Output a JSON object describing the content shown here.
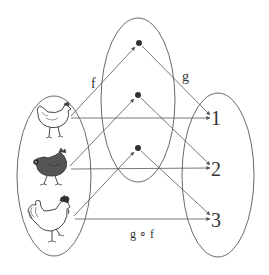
{
  "diagram": {
    "type": "function-composition",
    "sets": {
      "domain": {
        "name": "chickens",
        "elements": [
          "white-hen",
          "dark-hen",
          "white-rooster"
        ]
      },
      "middle": {
        "name": "intermediate-set",
        "elements": [
          "dot-1",
          "dot-2",
          "dot-3"
        ]
      },
      "codomain": {
        "name": "numbers",
        "elements": [
          "1",
          "2",
          "3"
        ]
      }
    },
    "labels": {
      "f": "f",
      "g": "g",
      "composition": "g ∘ f"
    },
    "codomain_labels": [
      "1",
      "2",
      "3"
    ],
    "mappings": {
      "f": [
        [
          "white-hen",
          "dot-1"
        ],
        [
          "dark-hen",
          "dot-2"
        ],
        [
          "white-rooster",
          "dot-3"
        ]
      ],
      "g": [
        [
          "dot-1",
          "1"
        ],
        [
          "dot-2",
          "2"
        ],
        [
          "dot-3",
          "3"
        ]
      ],
      "g_of_f": [
        [
          "white-hen",
          "1"
        ],
        [
          "dark-hen",
          "2"
        ],
        [
          "white-rooster",
          "3"
        ]
      ]
    },
    "colors": {
      "stroke": "#555555",
      "ellipse": "#6a6a6a",
      "dot": "#333333",
      "dark_hen": "#555555"
    }
  }
}
